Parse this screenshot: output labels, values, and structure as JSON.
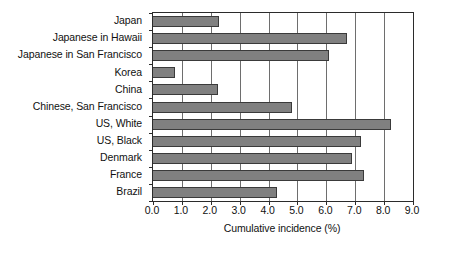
{
  "chart_data": {
    "type": "bar",
    "orientation": "horizontal",
    "title": "",
    "xlabel": "Cumulative incidence (%)",
    "ylabel": "",
    "xlim": [
      0.0,
      9.0
    ],
    "xticks": [
      "0.0",
      "1.0",
      "2.0",
      "3.0",
      "4.0",
      "5.0",
      "6.0",
      "7.0",
      "8.0",
      "9.0"
    ],
    "xtick_values": [
      0.0,
      1.0,
      2.0,
      3.0,
      4.0,
      5.0,
      6.0,
      7.0,
      8.0,
      9.0
    ],
    "grid": "vertical",
    "legend": "none",
    "bar_color": "#808080",
    "bar_edge_color": "#3a3a3a",
    "axis_color": "#2b2b2b",
    "categories": [
      "Japan",
      "Japanese in Hawaii",
      "Japanese in San Francisco",
      "Korea",
      "China",
      "Chinese, San Francisco",
      "US, White",
      "US, Black",
      "Denmark",
      "France",
      "Brazil"
    ],
    "values": [
      2.3,
      6.7,
      6.1,
      0.75,
      2.25,
      4.8,
      8.25,
      7.2,
      6.9,
      7.3,
      4.3
    ]
  }
}
